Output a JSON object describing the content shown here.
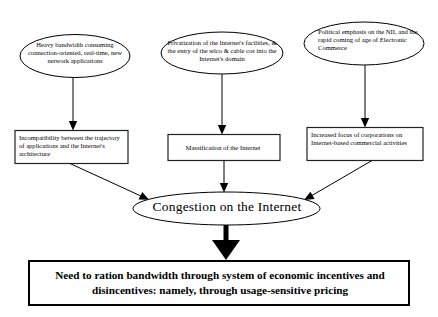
{
  "diagram": {
    "colors": {
      "stroke": "#000000",
      "box_stroke": "#222222",
      "background": "#ffffff",
      "text": "#000000"
    },
    "causes": [
      {
        "id": "cause-1",
        "shape": "ellipse",
        "text": "Heavy bandwidth consuming connection-oriented, real-time, new network applications"
      },
      {
        "id": "cause-2",
        "shape": "ellipse",
        "text": "Privatization of the Internet's facilities, & the entry of the telco & cable cos into the Internet's domain"
      },
      {
        "id": "cause-3",
        "shape": "ellipse",
        "text": "Political emphasis on the NII, and the rapid coming of age of Electronic Commerce"
      }
    ],
    "effects": [
      {
        "id": "effect-1",
        "shape": "box",
        "text": "Incompatibility between the trajectory of applications and the Internet's architecture"
      },
      {
        "id": "effect-2",
        "shape": "box",
        "text": "Massification of the Internet"
      },
      {
        "id": "effect-3",
        "shape": "box",
        "text": "Increased focus of corporations on Internet-based commercial activities"
      }
    ],
    "convergence": {
      "id": "congestion-node",
      "shape": "ellipse",
      "text": "Congestion on the Internet"
    },
    "conclusion": {
      "id": "conclusion-box",
      "shape": "box",
      "text": "Need to ration bandwidth through system of economic incentives and disincentives: namely, through usage-sensitive pricing"
    },
    "connectors": [
      {
        "from": "cause-1",
        "to": "effect-1",
        "style": "thin-arrow-vertical"
      },
      {
        "from": "cause-2",
        "to": "effect-2",
        "style": "thin-arrow-vertical"
      },
      {
        "from": "cause-3",
        "to": "effect-3",
        "style": "thin-arrow-vertical"
      },
      {
        "from": "effect-1",
        "to": "congestion-node",
        "style": "thin-arrow-diagonal"
      },
      {
        "from": "effect-2",
        "to": "congestion-node",
        "style": "thin-arrow-vertical"
      },
      {
        "from": "effect-3",
        "to": "congestion-node",
        "style": "thin-arrow-diagonal"
      },
      {
        "from": "congestion-node",
        "to": "conclusion-box",
        "style": "thick-arrow-vertical"
      }
    ]
  }
}
